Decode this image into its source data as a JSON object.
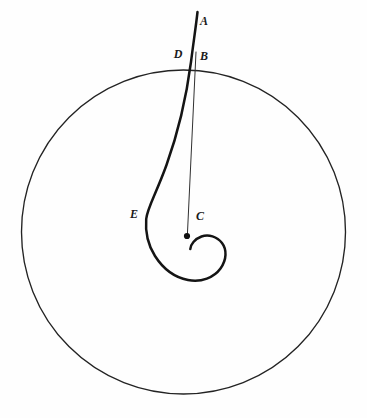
{
  "figure": {
    "background_color": "#fefefe",
    "ink_color": "#1c1c1c",
    "labels": [
      {
        "id": "A",
        "text": "A",
        "x": 204,
        "y": 22,
        "description": "upper terminus of spiral arm"
      },
      {
        "id": "B",
        "text": "B",
        "x": 204,
        "y": 57,
        "description": "point on circle, top of straight radius line"
      },
      {
        "id": "C",
        "text": "C",
        "x": 200,
        "y": 217,
        "description": "pole / center of spiral"
      },
      {
        "id": "D",
        "text": "D",
        "x": 178,
        "y": 55,
        "description": "intersection of spiral arm with circle"
      },
      {
        "id": "E",
        "text": "E",
        "x": 134,
        "y": 215,
        "description": "leftmost point of outer spiral arm"
      }
    ],
    "circle": {
      "name": "outer-circle",
      "center_x": 183.5,
      "center_y": 232,
      "radius": 162,
      "stroke_width": 1.35,
      "color": "#232323"
    },
    "pole": {
      "name": "spiral-pole",
      "x": 187,
      "y": 236,
      "radius": 3.1,
      "color": "#101010"
    },
    "spiral_arm": {
      "name": "spiral-curve",
      "stroke_width": 2.5,
      "color": "#141414",
      "path": "M 197.5 12 C 196.0 26 193.2 44 191.0 62 C 186.5 96 178.0 133 166.5 165 C 156.0 194 147.2 208 146.2 219 C 145.2 232 148.6 246 155.0 256 C 163.0 268.5 175.0 277.5 188.0 280.0 C 201.5 282.6 214.0 277.5 220.5 268.5 C 226.8 259.8 227.0 249.5 222.0 243.0 C 217.0 236.5 208.5 234.0 201.5 236.5 C 194.8 238.9 190.5 244.6 190.3 249.0"
    },
    "radius_line": {
      "name": "radius-segment-BC",
      "stroke_width": 1.0,
      "color": "#303030",
      "x1": 196.0,
      "y1": 52.0,
      "x2": 187.4,
      "y2": 234.5
    }
  }
}
